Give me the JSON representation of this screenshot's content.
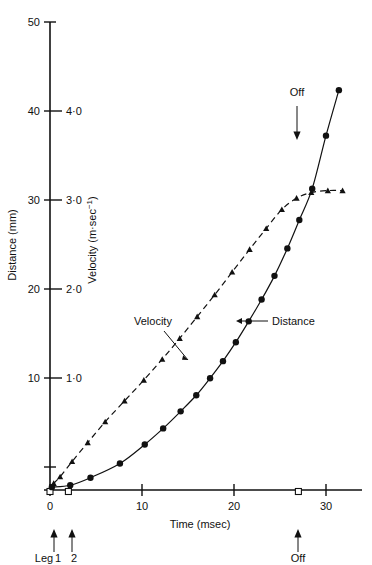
{
  "figure": {
    "title": "",
    "axes": {
      "x": {
        "label": "Time (msec)",
        "ticks": [
          "0",
          "10",
          "20",
          "30"
        ],
        "tick_values": [
          0,
          10,
          20,
          30
        ],
        "range": [
          -1,
          34
        ]
      },
      "y_left": {
        "label": "Distance (mm)",
        "ticks": [
          "10",
          "20",
          "30",
          "40",
          "50"
        ],
        "tick_values": [
          10,
          20,
          30,
          40,
          50
        ],
        "range": [
          0,
          50
        ]
      },
      "y_right": {
        "label_prefix": "Velocity (m",
        "label_mid": "·sec",
        "label_sup": "−1",
        "label_suffix": ")",
        "label": "Velocity (m·sec⁻¹)",
        "ticks": [
          "1·0",
          "2·0",
          "3·0",
          "4·0"
        ],
        "tick_values": [
          1.0,
          2.0,
          3.0,
          4.0
        ],
        "range": [
          0,
          5
        ]
      }
    },
    "annotations": {
      "velocity_label": "Velocity",
      "distance_label": "Distance",
      "off_label_plot": "Off",
      "off_label_axis": "Off",
      "leg_label": "Leg",
      "leg_1": "1",
      "leg_2": "2"
    },
    "colors": {
      "ink": "#111111",
      "background": "#ffffff"
    }
  },
  "chart_data": {
    "type": "scatter",
    "title": "",
    "xlabel": "Time (msec)",
    "ylabel": "Distance (mm)",
    "ylabel_secondary": "Velocity (m·sec⁻¹)",
    "xlim": [
      -1,
      34
    ],
    "ylim": [
      0,
      50
    ],
    "ylim_secondary": [
      0,
      5
    ],
    "grid": false,
    "legend": "inline-annotations",
    "series": [
      {
        "name": "Distance",
        "axis": "left",
        "units": "mm",
        "marker": "filled-circle",
        "line": "solid",
        "x": [
          0.2,
          2.2,
          4.4,
          7.6,
          10.3,
          12.3,
          14.2,
          15.9,
          17.4,
          18.8,
          20.2,
          21.6,
          23.0,
          24.4,
          25.8,
          27.1,
          28.5,
          30.0,
          31.4
        ],
        "y": [
          0.3,
          0.5,
          1.3,
          2.8,
          4.8,
          6.5,
          8.3,
          10.0,
          11.8,
          13.6,
          15.6,
          17.8,
          20.1,
          22.6,
          25.5,
          28.5,
          31.8,
          37.4,
          42.2
        ]
      },
      {
        "name": "Velocity",
        "axis": "right",
        "units": "m·sec⁻¹",
        "marker": "filled-triangle",
        "line": "dashed",
        "x": [
          0.4,
          1.1,
          2.4,
          4.1,
          6.0,
          8.1,
          10.2,
          12.2,
          14.1,
          16.0,
          17.9,
          19.8,
          21.7,
          23.5,
          25.2,
          26.8,
          28.4,
          30.2,
          31.8
        ],
        "y": [
          0.07,
          0.14,
          0.3,
          0.5,
          0.72,
          0.94,
          1.16,
          1.38,
          1.6,
          1.83,
          2.06,
          2.3,
          2.54,
          2.76,
          2.96,
          3.08,
          3.14,
          3.16,
          3.16
        ]
      }
    ],
    "axis_markers": {
      "name": "open-square-event-markers",
      "x": [
        0.0,
        2.0,
        27.0
      ]
    },
    "event_arrows": [
      {
        "label": "Leg 1",
        "x": 0.4,
        "direction": "up"
      },
      {
        "label": "2",
        "x": 2.3,
        "direction": "up"
      },
      {
        "label": "Off",
        "x": 27.0,
        "direction": "up"
      },
      {
        "label": "Off",
        "x": 27.0,
        "direction": "down",
        "position": "in-plot"
      }
    ]
  }
}
